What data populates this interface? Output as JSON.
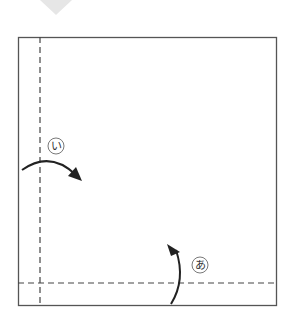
{
  "diagram": {
    "type": "origami-step",
    "labels": {
      "fold_a": "あ",
      "fold_i": "い"
    },
    "colors": {
      "line": "#333333",
      "paper_border": "#555555",
      "prev_arrow": "#e6e6e6"
    }
  }
}
